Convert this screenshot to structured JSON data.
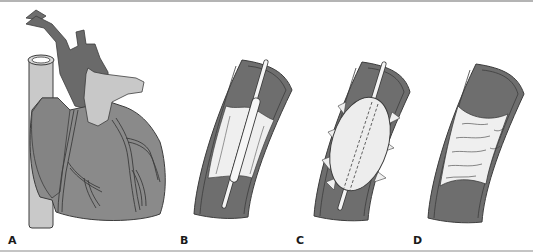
{
  "figure": {
    "panels": [
      {
        "id": "A",
        "label": "A",
        "depicts": "heart with coronary arteries"
      },
      {
        "id": "B",
        "label": "B",
        "depicts": "balloon catheter positioned in narrowed artery"
      },
      {
        "id": "C",
        "label": "C",
        "depicts": "balloon inflated compressing plaque"
      },
      {
        "id": "D",
        "label": "D",
        "depicts": "widened artery after angioplasty"
      }
    ],
    "colors": {
      "vessel_dark": "#6e6e6e",
      "vessel_wall": "#8c8c8c",
      "heart_body": "#8a8a8a",
      "heart_light": "#c8c8c8",
      "plaque": "#eeeeee",
      "outline": "#3c3c3c"
    }
  }
}
